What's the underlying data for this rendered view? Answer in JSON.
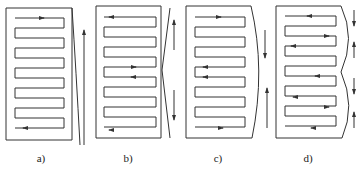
{
  "figure": {
    "panels": [
      {
        "id": "a",
        "label": "a)",
        "x": 6,
        "deform": "single-bow",
        "arrows": [
          "right-top",
          "left-bottom"
        ],
        "side_arrows": [
          "up"
        ]
      },
      {
        "id": "b",
        "label": "b)",
        "x": 96,
        "deform": "v-notch",
        "arrows": [
          "left-top",
          "right-mid",
          "left-mid",
          "left-bottom"
        ],
        "side_arrows": [
          "up",
          "down"
        ]
      },
      {
        "id": "c",
        "label": "c)",
        "x": 186,
        "deform": "convex-bow",
        "arrows": [
          "right-top",
          "left-mid",
          "left-mid",
          "right-bottom"
        ],
        "side_arrows": [
          "down",
          "up"
        ]
      },
      {
        "id": "d",
        "label": "d)",
        "x": 276,
        "deform": "double-bow",
        "arrows": [
          "left",
          "right",
          "left",
          "left",
          "left",
          "right",
          "left"
        ],
        "side_arrows": [
          "down",
          "up",
          "down",
          "up"
        ]
      }
    ],
    "stroke_color": "#333333",
    "background": "#ffffff"
  }
}
